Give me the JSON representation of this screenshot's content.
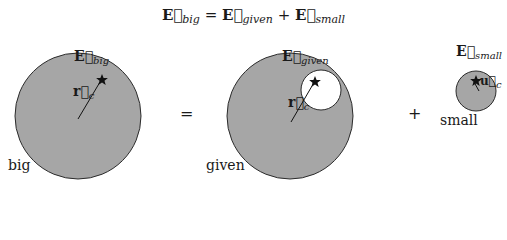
{
  "equation": {
    "lhs": {
      "symbol": "E",
      "subscript": "big"
    },
    "equals": "=",
    "rhs1": {
      "symbol": "E",
      "subscript": "given"
    },
    "plus": "+",
    "rhs2": {
      "symbol": "E",
      "subscript": "small"
    }
  },
  "panels": {
    "big": {
      "caption": "big",
      "field_label": {
        "symbol": "E",
        "subscript": "big"
      },
      "vector_label": {
        "symbol": "r",
        "subscript": "c"
      },
      "marker": "star"
    },
    "equals_sign": "=",
    "given": {
      "caption": "given",
      "field_label": {
        "symbol": "E",
        "subscript": "given"
      },
      "vector_label": {
        "symbol": "r",
        "subscript": "c"
      },
      "marker": "star"
    },
    "plus_sign": "+",
    "small": {
      "caption": "small",
      "field_label": {
        "symbol": "E",
        "subscript": "small"
      },
      "vector_label": {
        "symbol": "u",
        "subscript": "c"
      },
      "marker": "star"
    }
  },
  "colors": {
    "fill": "#a6a6a6",
    "stroke": "#2b2b2b",
    "hole": "#ffffff"
  }
}
